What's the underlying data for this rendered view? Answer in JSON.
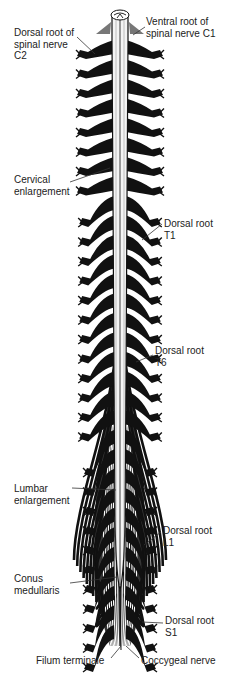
{
  "diagram": {
    "colors": {
      "ink": "#111111",
      "background": "#ffffff",
      "cord": "#f4f4f4"
    },
    "labels": [
      {
        "id": "dorsal-root-c2",
        "text": "Dorsal root of\nspinal nerve\nC2",
        "x": 14,
        "y": 27
      },
      {
        "id": "ventral-root-c1",
        "text": "Ventral root of\nspinal nerve C1",
        "x": 146,
        "y": 16
      },
      {
        "id": "cervical-enlargement",
        "text": "Cervical\nenlargement",
        "x": 14,
        "y": 174
      },
      {
        "id": "dorsal-root-t1",
        "text": "Dorsal root\nT1",
        "x": 164,
        "y": 218
      },
      {
        "id": "dorsal-root-t6",
        "text": "Dorsal root\nT6",
        "x": 155,
        "y": 345
      },
      {
        "id": "lumbar-enlargement",
        "text": "Lumbar\nenlargement",
        "x": 14,
        "y": 483
      },
      {
        "id": "dorsal-root-l1",
        "text": "Dorsal root\nL1",
        "x": 163,
        "y": 525
      },
      {
        "id": "conus-medullaris",
        "text": "Conus\nmedullaris",
        "x": 14,
        "y": 573
      },
      {
        "id": "dorsal-root-s1",
        "text": "Dorsal root\nS1",
        "x": 165,
        "y": 615
      },
      {
        "id": "filum-terminale",
        "text": "Filum terminale",
        "x": 36,
        "y": 655
      },
      {
        "id": "coccygeal-nerve",
        "text": "Coccygeal nerve",
        "x": 141,
        "y": 655
      }
    ],
    "leader_lines": [
      {
        "for": "dorsal-root-c2",
        "x1": 77,
        "y1": 37,
        "x2": 95,
        "y2": 54
      },
      {
        "for": "ventral-root-c1",
        "x1": 145,
        "y1": 27,
        "x2": 133,
        "y2": 35
      },
      {
        "for": "cervical-enlargement",
        "x1": 70,
        "y1": 182,
        "x2": 110,
        "y2": 168
      },
      {
        "for": "dorsal-root-t1",
        "x1": 162,
        "y1": 224,
        "x2": 142,
        "y2": 240
      },
      {
        "for": "dorsal-root-t6",
        "x1": 153,
        "y1": 355,
        "x2": 136,
        "y2": 362
      },
      {
        "for": "lumbar-enlargement",
        "x1": 72,
        "y1": 488,
        "x2": 116,
        "y2": 490
      },
      {
        "for": "dorsal-root-l1",
        "x1": 161,
        "y1": 532,
        "x2": 144,
        "y2": 545
      },
      {
        "for": "conus-medullaris",
        "x1": 70,
        "y1": 583,
        "x2": 117,
        "y2": 577
      },
      {
        "for": "dorsal-root-s1",
        "x1": 163,
        "y1": 623,
        "x2": 142,
        "y2": 622
      },
      {
        "for": "filum-terminale",
        "x1": 111,
        "y1": 658,
        "x2": 121,
        "y2": 646
      },
      {
        "for": "coccygeal-nerve",
        "x1": 139,
        "y1": 658,
        "x2": 126,
        "y2": 646
      }
    ]
  }
}
